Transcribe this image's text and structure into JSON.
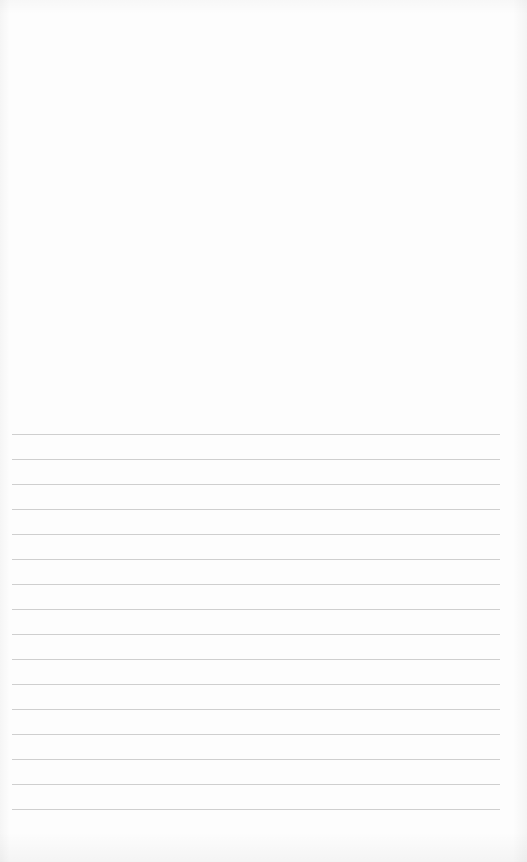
{
  "page": {
    "type": "lined-paper",
    "background_color": "#fdfdfd",
    "line_color": "#cfcfcf"
  },
  "ruled_lines": {
    "count": 16,
    "first_y": 434,
    "spacing": 25,
    "left": 12,
    "right": 500
  }
}
